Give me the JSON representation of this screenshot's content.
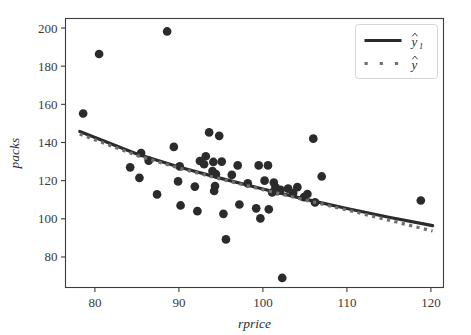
{
  "figure": {
    "background_color": "#ffffff",
    "axes_edge_color": "#3c3c3c",
    "point_color": "#2b2b2b",
    "fit_line_color": "#2b2b2b",
    "dotted_line_color": "#6f6f6f"
  },
  "chart_data": {
    "type": "scatter",
    "title": "",
    "xlabel": "rprice",
    "ylabel": "packs",
    "xlim": [
      76.5,
      121.5
    ],
    "ylim": [
      64,
      205
    ],
    "xticks": [
      80,
      90,
      100,
      110,
      120
    ],
    "yticks": [
      80,
      100,
      120,
      140,
      160,
      180,
      200
    ],
    "xtick_labels": [
      "80",
      "90",
      "100",
      "110",
      "120"
    ],
    "ytick_labels": [
      "80",
      "100",
      "120",
      "140",
      "160",
      "180",
      "200"
    ],
    "grid": false,
    "legend_position": "upper right",
    "legend": [
      {
        "label": "ŷ₁",
        "base": "y",
        "sub": "1",
        "style": "solid",
        "color": "#2b2b2b",
        "linewidth": 3.2
      },
      {
        "label": "ŷ",
        "base": "y",
        "sub": "",
        "style": "dotted",
        "color": "#6f6f6f",
        "linewidth": 3.2
      }
    ],
    "series": [
      {
        "name": "observations",
        "type": "scatter",
        "marker": "o",
        "color": "#2b2b2b",
        "size": 7.5,
        "points": [
          [
            78.6,
            155.2
          ],
          [
            80.5,
            186.4
          ],
          [
            84.2,
            127.0
          ],
          [
            85.3,
            121.5
          ],
          [
            85.5,
            134.5
          ],
          [
            86.4,
            130.5
          ],
          [
            87.4,
            112.8
          ],
          [
            88.6,
            198.2
          ],
          [
            89.4,
            137.7
          ],
          [
            89.9,
            119.6
          ],
          [
            90.1,
            127.5
          ],
          [
            90.2,
            107.0
          ],
          [
            91.9,
            116.9
          ],
          [
            92.2,
            104.0
          ],
          [
            92.5,
            130.3
          ],
          [
            93.0,
            128.6
          ],
          [
            93.2,
            132.8
          ],
          [
            93.6,
            145.3
          ],
          [
            94.0,
            125.0
          ],
          [
            94.1,
            129.8
          ],
          [
            94.2,
            114.6
          ],
          [
            94.3,
            117.2
          ],
          [
            94.4,
            123.4
          ],
          [
            94.8,
            143.5
          ],
          [
            95.1,
            130.0
          ],
          [
            95.3,
            102.6
          ],
          [
            95.6,
            89.2
          ],
          [
            96.3,
            123.0
          ],
          [
            97.0,
            128.0
          ],
          [
            97.2,
            107.5
          ],
          [
            98.2,
            118.6
          ],
          [
            99.2,
            105.5
          ],
          [
            99.5,
            128.0
          ],
          [
            99.7,
            100.2
          ],
          [
            100.2,
            120.0
          ],
          [
            100.6,
            128.0
          ],
          [
            100.7,
            105.0
          ],
          [
            101.1,
            113.8
          ],
          [
            101.3,
            119.0
          ],
          [
            101.5,
            116.5
          ],
          [
            101.7,
            114.5
          ],
          [
            102.1,
            115.2
          ],
          [
            102.3,
            69.0
          ],
          [
            103.0,
            115.8
          ],
          [
            103.6,
            113.5
          ],
          [
            104.1,
            116.6
          ],
          [
            104.9,
            111.4
          ],
          [
            105.3,
            113.0
          ],
          [
            106.0,
            142.0
          ],
          [
            106.2,
            108.6
          ],
          [
            107.0,
            122.2
          ],
          [
            118.8,
            109.6
          ]
        ]
      },
      {
        "name": "fit-solid",
        "type": "line",
        "style": "solid",
        "color": "#2b2b2b",
        "linewidth": 3.2,
        "points": [
          [
            78.2,
            145.8
          ],
          [
            85.0,
            134.0
          ],
          [
            90.0,
            127.2
          ],
          [
            95.0,
            121.2
          ],
          [
            100.0,
            115.6
          ],
          [
            105.0,
            110.3
          ],
          [
            110.0,
            105.4
          ],
          [
            115.0,
            100.8
          ],
          [
            120.2,
            96.4
          ]
        ]
      },
      {
        "name": "fit-dotted",
        "type": "line",
        "style": "dotted",
        "color": "#6f6f6f",
        "linewidth": 3.2,
        "points": [
          [
            78.2,
            144.4
          ],
          [
            85.0,
            133.2
          ],
          [
            90.0,
            126.6
          ],
          [
            95.0,
            120.8
          ],
          [
            100.0,
            115.3
          ],
          [
            105.0,
            109.9
          ],
          [
            110.0,
            104.6
          ],
          [
            115.0,
            99.3
          ],
          [
            120.2,
            93.6
          ]
        ]
      }
    ]
  }
}
